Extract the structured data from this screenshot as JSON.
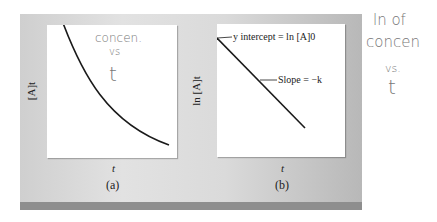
{
  "figure": {
    "panel_a": {
      "y_label": "[A]t",
      "x_label": "t",
      "caption": "(a)",
      "curve": "exponential decay",
      "handwritten_note": [
        "concen.",
        "vs",
        "t"
      ]
    },
    "panel_b": {
      "y_label": "ln [A]t",
      "x_label": "t",
      "caption": "(b)",
      "curve": "straight line, negative slope",
      "annotations": {
        "intercept": "y intercept = ln [A]0",
        "slope": "Slope = −k"
      }
    },
    "margin_note": [
      "ln of",
      "concen",
      "vs.",
      "t"
    ]
  },
  "colors": {
    "panel_bg": "#d8d8d8",
    "bottom_bar": "#8e8e8e",
    "curve": "#1a1a1a",
    "handwriting": "#777777"
  }
}
